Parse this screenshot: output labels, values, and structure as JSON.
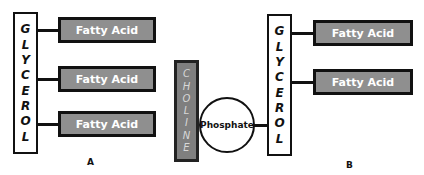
{
  "diagram": {
    "type": "lipid-structure-comparison",
    "panel_a": {
      "label": "A",
      "backbone": {
        "letters": [
          "G",
          "L",
          "Y",
          "C",
          "E",
          "R",
          "O",
          "L"
        ],
        "text": "GLYCEROL"
      },
      "chains": [
        {
          "label": "Fatty Acid"
        },
        {
          "label": "Fatty Acid"
        },
        {
          "label": "Fatty Acid"
        }
      ]
    },
    "panel_b": {
      "label": "B",
      "head_group": {
        "letters": [
          "C",
          "H",
          "O",
          "L",
          "I",
          "N",
          "E"
        ],
        "text": "CHOLINE"
      },
      "linker": {
        "label": "Phosphate"
      },
      "backbone": {
        "letters": [
          "G",
          "L",
          "Y",
          "C",
          "E",
          "R",
          "O",
          "L"
        ],
        "text": "GLYCEROL"
      },
      "chains": [
        {
          "label": "Fatty Acid"
        },
        {
          "label": "Fatty Acid"
        }
      ]
    },
    "colors": {
      "fatty_acid_fill": "#8f8f8f",
      "choline_fill": "#7f7f7f",
      "outline": "#111111",
      "background": "#ffffff"
    }
  }
}
